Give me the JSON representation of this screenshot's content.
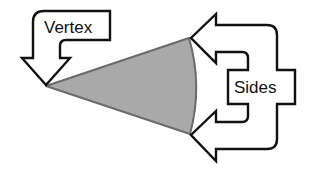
{
  "diagram": {
    "shape": {
      "type": "sector",
      "fill": "#a9a9a9",
      "stroke": "#6a6a6a"
    },
    "labels": {
      "vertex": "Vertex",
      "sides": "Sides"
    },
    "colors": {
      "outline": "#111111",
      "background": "#ffffff"
    }
  }
}
